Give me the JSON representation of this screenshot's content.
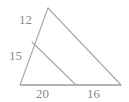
{
  "figure": {
    "kind": "geometry-diagram",
    "shape": "triangle-with-cevian",
    "colors": {
      "background": "#ffffff",
      "stroke": "#a9a9a9",
      "base_stroke": "#9d9d9d",
      "label_text": "#8a8a8a"
    },
    "vertices": {
      "apex": {
        "x": 48,
        "y": 8
      },
      "bottom_left": {
        "x": 20,
        "y": 85
      },
      "bottom_right": {
        "x": 121,
        "y": 85
      },
      "left_side_point": {
        "x": 32,
        "y": 42
      },
      "base_point": {
        "x": 76,
        "y": 85
      }
    },
    "edges": [
      {
        "name": "left-side",
        "from": "apex",
        "to": "bottom_left"
      },
      {
        "name": "right-side",
        "from": "apex",
        "to": "bottom_right"
      },
      {
        "name": "base",
        "from": "bottom_left",
        "to": "bottom_right"
      },
      {
        "name": "cevian",
        "from": "left_side_point",
        "to": "base_point"
      }
    ],
    "labels": {
      "upper_left_segment": "12",
      "lower_left_segment": "15",
      "base_left_segment": "20",
      "base_right_segment": "16"
    }
  }
}
